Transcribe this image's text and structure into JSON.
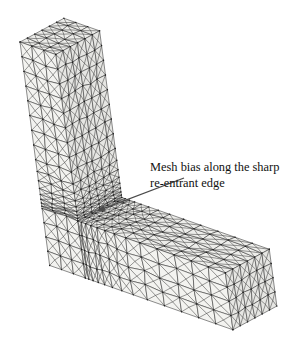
{
  "figure": {
    "annotation": {
      "line1": "Mesh bias along the sharp",
      "line2": "re-entrant edge"
    },
    "colors": {
      "background": "#ffffff",
      "mesh_line": "#2e2e2e",
      "node_dot": "#1c1c1c",
      "face_top": "#ededea",
      "face_front": "#f3f3f0",
      "face_side": "#e6e6e3",
      "arrow": "#4a4a4a",
      "text": "#111111"
    },
    "geometry": {
      "origin": [
        20,
        42
      ],
      "axisX": [
        0.94,
        0.33
      ],
      "axisY": [
        0.878,
        -0.474
      ],
      "axisZdown": [
        0.13,
        0.98
      ],
      "colWidth": 38,
      "depth": 50,
      "height": 228,
      "armHeight": 58,
      "armLength": 195
    },
    "mesh_params": {
      "colDivX": 3,
      "divY": 6,
      "colRows": 16,
      "colBiasRatio": 0.8,
      "colBiasFlatUntil": 7,
      "armCols": 13,
      "armBiasRatio": 0.82,
      "armBiasFlatFrom": 8,
      "armRows": 4,
      "jitter": 1.2,
      "nodeRadius": 0.7,
      "lineWidth": 0.55
    },
    "arrow": {
      "from": [
        184,
        178
      ],
      "to": [
        97,
        211
      ],
      "headLength": 8,
      "headWidth": 5.6
    }
  }
}
